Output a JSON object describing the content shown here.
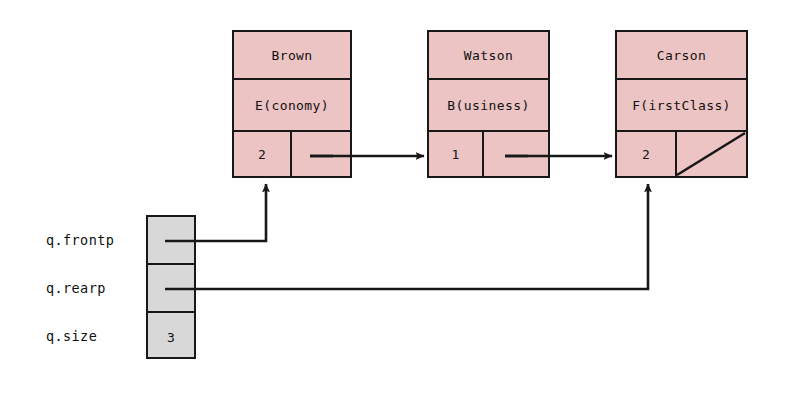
{
  "diagram": {
    "colors": {
      "node_fill": "#edc4c4",
      "var_fill": "#d8d8d8",
      "stroke": "#181818",
      "background": "#ffffff"
    }
  },
  "nodes": [
    {
      "name": "Brown",
      "seat_class": "E(conomy)",
      "count": "2"
    },
    {
      "name": "Watson",
      "seat_class": "B(usiness)",
      "count": "1"
    },
    {
      "name": "Carson",
      "seat_class": "F(irstClass)",
      "count": "2"
    }
  ],
  "variables": [
    {
      "label": "q.frontp",
      "value": ""
    },
    {
      "label": "q.rearp",
      "value": ""
    },
    {
      "label": "q.size",
      "value": "3"
    }
  ]
}
